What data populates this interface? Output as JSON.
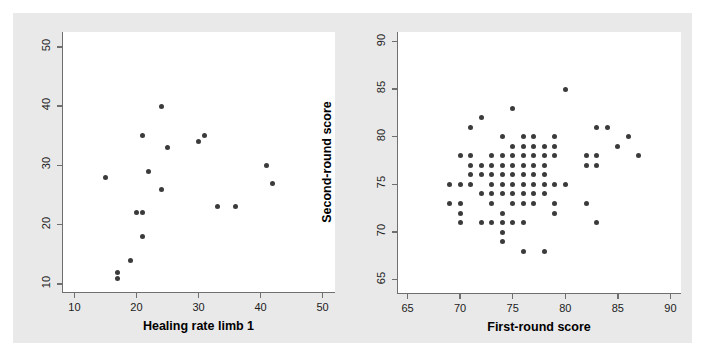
{
  "figure": {
    "background_color": "#e9e9e9",
    "panel_color": "#ffffff",
    "point_color": "#3b3b3b",
    "axis_color": "#6f6f6f"
  },
  "chart_data": [
    {
      "type": "scatter",
      "panel": "left",
      "title": "",
      "xlabel": "Healing rate limb 1",
      "ylabel": "Healing rate limb 2",
      "xlim": [
        8,
        52
      ],
      "ylim": [
        8.5,
        52.5
      ],
      "xticks": [
        10,
        20,
        30,
        40,
        50
      ],
      "yticks": [
        10,
        20,
        30,
        40,
        50
      ],
      "xticklabels": [
        "10",
        "20",
        "30",
        "40",
        "50"
      ],
      "yticklabels": [
        "10",
        "20",
        "30",
        "40",
        "50"
      ],
      "grid": false,
      "legend": false,
      "n_points": 18,
      "points": [
        [
          17,
          11
        ],
        [
          17,
          12
        ],
        [
          19,
          14
        ],
        [
          21,
          18
        ],
        [
          20,
          22
        ],
        [
          21,
          22
        ],
        [
          15,
          28
        ],
        [
          22,
          29
        ],
        [
          24,
          26
        ],
        [
          21,
          35
        ],
        [
          25,
          33
        ],
        [
          24,
          40
        ],
        [
          30,
          34
        ],
        [
          31,
          35
        ],
        [
          33,
          23
        ],
        [
          36,
          23
        ],
        [
          41,
          30
        ],
        [
          42,
          27
        ]
      ]
    },
    {
      "type": "scatter",
      "panel": "right",
      "title": "",
      "xlabel": "First-round score",
      "ylabel": "Second-round score",
      "xlim": [
        64,
        91
      ],
      "ylim": [
        63.5,
        91
      ],
      "xticks": [
        65,
        70,
        75,
        80,
        85,
        90
      ],
      "yticks": [
        65,
        70,
        75,
        80,
        85,
        90
      ],
      "xticklabels": [
        "65",
        "70",
        "75",
        "80",
        "85",
        "90"
      ],
      "yticklabels": [
        "65",
        "70",
        "75",
        "80",
        "85",
        "90"
      ],
      "grid": false,
      "legend": false,
      "n_points": 86,
      "points": [
        [
          69,
          75
        ],
        [
          70,
          75
        ],
        [
          69,
          73
        ],
        [
          70,
          78
        ],
        [
          71,
          78
        ],
        [
          71,
          81
        ],
        [
          72,
          82
        ],
        [
          70,
          73
        ],
        [
          70,
          72
        ],
        [
          70,
          71
        ],
        [
          71,
          77
        ],
        [
          71,
          76
        ],
        [
          71,
          75
        ],
        [
          72,
          77
        ],
        [
          72,
          76
        ],
        [
          72,
          74
        ],
        [
          72,
          71
        ],
        [
          73,
          78
        ],
        [
          73,
          77
        ],
        [
          73,
          76
        ],
        [
          73,
          75
        ],
        [
          73,
          73
        ],
        [
          73,
          71
        ],
        [
          74,
          80
        ],
        [
          74,
          78
        ],
        [
          74,
          77
        ],
        [
          74,
          76
        ],
        [
          74,
          75
        ],
        [
          74,
          74
        ],
        [
          74,
          72
        ],
        [
          74,
          71
        ],
        [
          74,
          70
        ],
        [
          74,
          69
        ],
        [
          75,
          83
        ],
        [
          75,
          78
        ],
        [
          75,
          77
        ],
        [
          75,
          76
        ],
        [
          75,
          75
        ],
        [
          75,
          74
        ],
        [
          75,
          73
        ],
        [
          75,
          71
        ],
        [
          76,
          80
        ],
        [
          76,
          79
        ],
        [
          76,
          78
        ],
        [
          76,
          77
        ],
        [
          76,
          76
        ],
        [
          76,
          75
        ],
        [
          76,
          74
        ],
        [
          76,
          73
        ],
        [
          76,
          71
        ],
        [
          76,
          68
        ],
        [
          77,
          80
        ],
        [
          77,
          79
        ],
        [
          77,
          78
        ],
        [
          77,
          77
        ],
        [
          77,
          76
        ],
        [
          77,
          75
        ],
        [
          77,
          74
        ],
        [
          77,
          73
        ],
        [
          78,
          79
        ],
        [
          78,
          78
        ],
        [
          78,
          77
        ],
        [
          78,
          76
        ],
        [
          78,
          75
        ],
        [
          78,
          74
        ],
        [
          78,
          68
        ],
        [
          79,
          80
        ],
        [
          79,
          79
        ],
        [
          79,
          78
        ],
        [
          79,
          75
        ],
        [
          79,
          73
        ],
        [
          79,
          72
        ],
        [
          80,
          85
        ],
        [
          80,
          75
        ],
        [
          82,
          77
        ],
        [
          82,
          78
        ],
        [
          82,
          73
        ],
        [
          83,
          81
        ],
        [
          83,
          78
        ],
        [
          83,
          77
        ],
        [
          83,
          71
        ],
        [
          84,
          81
        ],
        [
          85,
          79
        ],
        [
          86,
          80
        ],
        [
          87,
          78
        ],
        [
          75,
          79
        ],
        [
          73,
          74
        ]
      ]
    }
  ]
}
